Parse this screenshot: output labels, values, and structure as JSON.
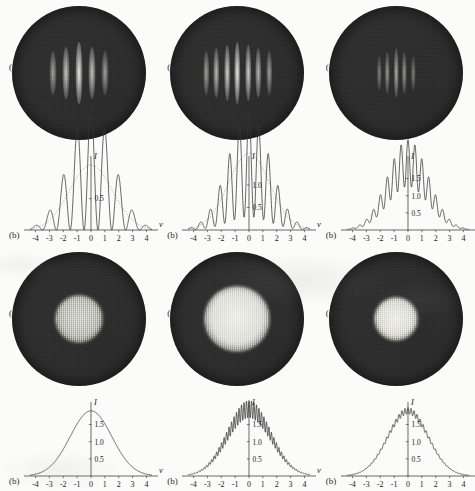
{
  "figure": {
    "title_visible": "",
    "panel_label_a": "(a)",
    "panel_label_b": "(b)",
    "y_axis_name": "I",
    "x_axis_name": "v",
    "x_ticks": [
      "-4",
      "-3",
      "-2",
      "-1",
      "0",
      "1",
      "2",
      "3",
      "4"
    ],
    "colors": {
      "page_background": "#fbfbf9",
      "disc_dark": "#2e2e2e",
      "fringe_bright": "#e8e8e0",
      "curve": "#333333",
      "envelope": "#8d8d8d",
      "ink": "#222222"
    }
  },
  "chart_data": [
    {
      "id": "panel-r1c1",
      "type": "line",
      "title": "",
      "xlabel": "v",
      "ylabel": "I",
      "xlim": [
        -4.4,
        4.4
      ],
      "ylim": [
        0,
        1.15
      ],
      "grid": false,
      "legend": "none",
      "x_ticks": [
        -4,
        -3,
        -2,
        -1,
        0,
        1,
        2,
        3,
        4
      ],
      "y_ticks": [
        0.5
      ],
      "y_tick_labels": [
        "0.5"
      ],
      "image": {
        "kind": "circular-fringe-pattern",
        "fringe_count": 5,
        "fringe_contrast": "high",
        "fringe_spacing": "wide",
        "background": "dark-speckle"
      },
      "series": [
        {
          "name": "intensity",
          "model": "modulated-gaussian",
          "envelope_sigma": 1.55,
          "envelope_peak": 1.0,
          "fringe_period": 1.0,
          "visibility": 1.0,
          "peak_value": 1.0
        },
        {
          "name": "envelope",
          "model": "gaussian",
          "sigma": 1.55,
          "peak": 0.52,
          "style": "dashed"
        }
      ]
    },
    {
      "id": "panel-r1c2",
      "type": "line",
      "title": "",
      "xlabel": "v",
      "ylabel": "I",
      "xlim": [
        -4.4,
        4.4
      ],
      "ylim": [
        0,
        1.6
      ],
      "grid": false,
      "legend": "none",
      "x_ticks": [
        -4,
        -3,
        -2,
        -1,
        0,
        1,
        2,
        3,
        4
      ],
      "y_ticks": [
        0.5,
        1.0
      ],
      "y_tick_labels": [
        "0.5",
        "1.0"
      ],
      "image": {
        "kind": "circular-fringe-pattern",
        "fringe_count": 7,
        "fringe_contrast": "high",
        "fringe_spacing": "medium",
        "background": "dark-speckle"
      },
      "series": [
        {
          "name": "intensity",
          "model": "modulated-gaussian",
          "envelope_sigma": 1.5,
          "envelope_peak": 1.45,
          "fringe_period": 0.7,
          "visibility": 0.8,
          "peak_value": 1.45
        },
        {
          "name": "envelope",
          "model": "gaussian",
          "sigma": 1.5,
          "peak": 0.85,
          "style": "dashed"
        }
      ]
    },
    {
      "id": "panel-r1c3",
      "type": "line",
      "title": "",
      "xlabel": "v",
      "ylabel": "I",
      "xlim": [
        -4.4,
        4.4
      ],
      "ylim": [
        0,
        2.1
      ],
      "grid": false,
      "legend": "none",
      "x_ticks": [
        -4,
        -3,
        -2,
        -1,
        0,
        1,
        2,
        3,
        4
      ],
      "y_ticks": [
        0.5,
        1.0,
        1.5
      ],
      "y_tick_labels": [
        "0.5",
        "1.0",
        "1.5"
      ],
      "image": {
        "kind": "circular-fringe-pattern",
        "fringe_count": 5,
        "fringe_contrast": "low",
        "fringe_spacing": "narrow",
        "background": "dark-speckle"
      },
      "series": [
        {
          "name": "intensity",
          "model": "modulated-gaussian",
          "envelope_sigma": 1.45,
          "envelope_peak": 1.95,
          "fringe_period": 0.5,
          "visibility": 0.35,
          "peak_value": 1.95
        }
      ]
    },
    {
      "id": "panel-r2c1",
      "type": "line",
      "title": "",
      "xlabel": "v",
      "ylabel": "I",
      "xlim": [
        -4.4,
        4.4
      ],
      "ylim": [
        0,
        2.1
      ],
      "grid": false,
      "legend": "none",
      "x_ticks": [
        -4,
        -3,
        -2,
        -1,
        0,
        1,
        2,
        3,
        4
      ],
      "y_ticks": [
        0.5,
        1.0,
        1.5
      ],
      "y_tick_labels": [
        "0.5",
        "1.0",
        "1.5"
      ],
      "image": {
        "kind": "circular-diffuse-blob",
        "fringe_count": 0,
        "blob_radius": 24,
        "blob_contrast": "medium",
        "background": "dark-speckle"
      },
      "series": [
        {
          "name": "intensity",
          "model": "gaussian",
          "sigma": 1.5,
          "peak": 1.9,
          "visibility": 0.0,
          "peak_value": 1.9
        }
      ]
    },
    {
      "id": "panel-r2c2",
      "type": "line",
      "title": "",
      "xlabel": "v",
      "ylabel": "I",
      "xlim": [
        -4.4,
        4.4
      ],
      "ylim": [
        0,
        2.1
      ],
      "grid": false,
      "legend": "none",
      "x_ticks": [
        -4,
        -3,
        -2,
        -1,
        0,
        1,
        2,
        3,
        4
      ],
      "y_ticks": [
        0.5,
        1.0,
        1.5
      ],
      "y_tick_labels": [
        "0.5",
        "1.0",
        "1.5"
      ],
      "image": {
        "kind": "circular-diffuse-blob",
        "fringe_count": 0,
        "blob_radius": 33,
        "blob_contrast": "high",
        "background": "dark-speckle"
      },
      "series": [
        {
          "name": "intensity",
          "model": "ripple-gaussian",
          "sigma": 1.55,
          "peak": 1.95,
          "ripple_period": 0.18,
          "ripple_amplitude": 0.13,
          "visibility": 0.07,
          "peak_value": 1.95
        }
      ]
    },
    {
      "id": "panel-r2c3",
      "type": "line",
      "title": "",
      "xlabel": "v",
      "ylabel": "I",
      "xlim": [
        -4.4,
        4.4
      ],
      "ylim": [
        0,
        2.1
      ],
      "grid": false,
      "legend": "none",
      "x_ticks": [
        -4,
        -3,
        -2,
        -1,
        0,
        1,
        2,
        3,
        4
      ],
      "y_ticks": [
        0.5,
        1.0,
        1.5
      ],
      "y_tick_labels": [
        "0.5",
        "1.0",
        "1.5"
      ],
      "image": {
        "kind": "circular-diffuse-blob",
        "fringe_count": 0,
        "blob_radius": 22,
        "blob_contrast": "high",
        "background": "dark-speckle"
      },
      "series": [
        {
          "name": "intensity",
          "model": "ripple-gaussian",
          "sigma": 1.45,
          "peak": 1.9,
          "ripple_period": 0.22,
          "ripple_amplitude": 0.05,
          "visibility": 0.03,
          "peak_value": 1.9
        }
      ]
    }
  ]
}
